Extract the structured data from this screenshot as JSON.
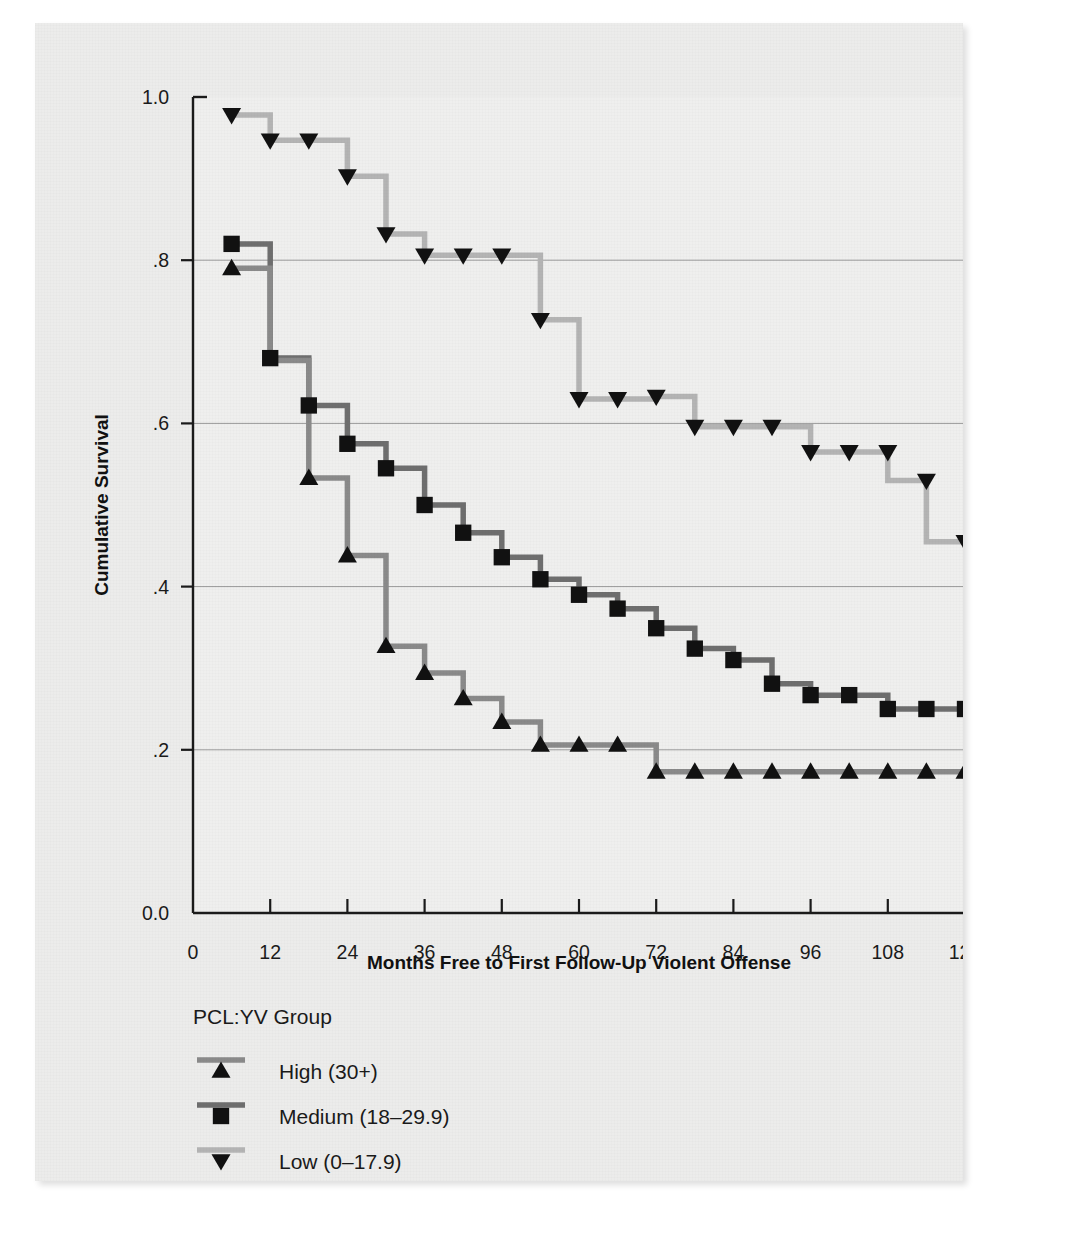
{
  "chart_data": {
    "type": "line",
    "subtype": "kaplan-meier-step",
    "title": "",
    "xlabel": "Months Free to First Follow-Up Violent Offense",
    "ylabel": "Cumulative Survival",
    "xlim": [
      0,
      120
    ],
    "ylim": [
      0.0,
      1.0
    ],
    "xticks": [
      0,
      12,
      24,
      36,
      48,
      60,
      72,
      84,
      96,
      108,
      120
    ],
    "xtick_labels": [
      "0",
      "12",
      "24",
      "36",
      "48",
      "60",
      "72",
      "84",
      "96",
      "108",
      "120"
    ],
    "yticks": [
      0.0,
      0.2,
      0.4,
      0.6,
      0.8,
      1.0
    ],
    "ytick_labels": [
      "0.0",
      ".2",
      ".4",
      ".6",
      ".8",
      "1.0"
    ],
    "grid": "horizontal gridlines at .2 .4 .6 .8",
    "legend_position": "below-axes-left",
    "legend_title": "PCL:YV Group",
    "series": [
      {
        "name": "High (30+)",
        "marker": "triangle-up",
        "color": "#8a8a8a",
        "marker_color": "#111111",
        "points": [
          {
            "x": 6,
            "y": 0.79
          },
          {
            "x": 12,
            "y": 0.79
          },
          {
            "x": 12,
            "y": 0.677
          },
          {
            "x": 18,
            "y": 0.677
          },
          {
            "x": 18,
            "y": 0.533
          },
          {
            "x": 24,
            "y": 0.533
          },
          {
            "x": 24,
            "y": 0.438
          },
          {
            "x": 30,
            "y": 0.438
          },
          {
            "x": 30,
            "y": 0.327
          },
          {
            "x": 36,
            "y": 0.327
          },
          {
            "x": 36,
            "y": 0.294
          },
          {
            "x": 42,
            "y": 0.294
          },
          {
            "x": 42,
            "y": 0.263
          },
          {
            "x": 48,
            "y": 0.263
          },
          {
            "x": 48,
            "y": 0.234
          },
          {
            "x": 54,
            "y": 0.234
          },
          {
            "x": 54,
            "y": 0.206
          },
          {
            "x": 66,
            "y": 0.206
          },
          {
            "x": 72,
            "y": 0.206
          },
          {
            "x": 72,
            "y": 0.173
          },
          {
            "x": 120,
            "y": 0.173
          }
        ],
        "marker_points": [
          {
            "x": 6,
            "y": 0.79
          },
          {
            "x": 18,
            "y": 0.533
          },
          {
            "x": 24,
            "y": 0.438
          },
          {
            "x": 30,
            "y": 0.327
          },
          {
            "x": 36,
            "y": 0.294
          },
          {
            "x": 42,
            "y": 0.263
          },
          {
            "x": 48,
            "y": 0.234
          },
          {
            "x": 54,
            "y": 0.206
          },
          {
            "x": 60,
            "y": 0.206
          },
          {
            "x": 66,
            "y": 0.206
          },
          {
            "x": 72,
            "y": 0.173
          },
          {
            "x": 78,
            "y": 0.173
          },
          {
            "x": 84,
            "y": 0.173
          },
          {
            "x": 90,
            "y": 0.173
          },
          {
            "x": 96,
            "y": 0.173
          },
          {
            "x": 102,
            "y": 0.173
          },
          {
            "x": 108,
            "y": 0.173
          },
          {
            "x": 114,
            "y": 0.173
          },
          {
            "x": 120,
            "y": 0.173
          }
        ]
      },
      {
        "name": "Medium (18–29.9)",
        "marker": "square",
        "color": "#6e6e6e",
        "marker_color": "#111111",
        "points": [
          {
            "x": 6,
            "y": 0.82
          },
          {
            "x": 12,
            "y": 0.82
          },
          {
            "x": 12,
            "y": 0.68
          },
          {
            "x": 18,
            "y": 0.68
          },
          {
            "x": 18,
            "y": 0.622
          },
          {
            "x": 24,
            "y": 0.622
          },
          {
            "x": 24,
            "y": 0.575
          },
          {
            "x": 30,
            "y": 0.575
          },
          {
            "x": 30,
            "y": 0.545
          },
          {
            "x": 36,
            "y": 0.545
          },
          {
            "x": 36,
            "y": 0.5
          },
          {
            "x": 42,
            "y": 0.5
          },
          {
            "x": 42,
            "y": 0.466
          },
          {
            "x": 48,
            "y": 0.466
          },
          {
            "x": 48,
            "y": 0.436
          },
          {
            "x": 54,
            "y": 0.436
          },
          {
            "x": 54,
            "y": 0.409
          },
          {
            "x": 60,
            "y": 0.409
          },
          {
            "x": 60,
            "y": 0.39
          },
          {
            "x": 66,
            "y": 0.39
          },
          {
            "x": 66,
            "y": 0.373
          },
          {
            "x": 72,
            "y": 0.373
          },
          {
            "x": 72,
            "y": 0.349
          },
          {
            "x": 78,
            "y": 0.349
          },
          {
            "x": 78,
            "y": 0.324
          },
          {
            "x": 84,
            "y": 0.324
          },
          {
            "x": 84,
            "y": 0.31
          },
          {
            "x": 90,
            "y": 0.31
          },
          {
            "x": 90,
            "y": 0.281
          },
          {
            "x": 96,
            "y": 0.281
          },
          {
            "x": 96,
            "y": 0.267
          },
          {
            "x": 108,
            "y": 0.267
          },
          {
            "x": 108,
            "y": 0.25
          },
          {
            "x": 120,
            "y": 0.25
          }
        ],
        "marker_points": [
          {
            "x": 6,
            "y": 0.82
          },
          {
            "x": 12,
            "y": 0.68
          },
          {
            "x": 18,
            "y": 0.622
          },
          {
            "x": 24,
            "y": 0.575
          },
          {
            "x": 30,
            "y": 0.545
          },
          {
            "x": 36,
            "y": 0.5
          },
          {
            "x": 42,
            "y": 0.466
          },
          {
            "x": 48,
            "y": 0.436
          },
          {
            "x": 54,
            "y": 0.409
          },
          {
            "x": 60,
            "y": 0.39
          },
          {
            "x": 66,
            "y": 0.373
          },
          {
            "x": 72,
            "y": 0.349
          },
          {
            "x": 78,
            "y": 0.324
          },
          {
            "x": 84,
            "y": 0.31
          },
          {
            "x": 90,
            "y": 0.281
          },
          {
            "x": 96,
            "y": 0.267
          },
          {
            "x": 102,
            "y": 0.267
          },
          {
            "x": 108,
            "y": 0.25
          },
          {
            "x": 114,
            "y": 0.25
          },
          {
            "x": 120,
            "y": 0.25
          }
        ]
      },
      {
        "name": "Low (0–17.9)",
        "marker": "triangle-down",
        "color": "#b4b4b4",
        "marker_color": "#111111",
        "points": [
          {
            "x": 6,
            "y": 0.978
          },
          {
            "x": 12,
            "y": 0.978
          },
          {
            "x": 12,
            "y": 0.947
          },
          {
            "x": 24,
            "y": 0.947
          },
          {
            "x": 24,
            "y": 0.903
          },
          {
            "x": 30,
            "y": 0.903
          },
          {
            "x": 30,
            "y": 0.832
          },
          {
            "x": 36,
            "y": 0.832
          },
          {
            "x": 36,
            "y": 0.806
          },
          {
            "x": 48,
            "y": 0.806
          },
          {
            "x": 54,
            "y": 0.806
          },
          {
            "x": 54,
            "y": 0.727
          },
          {
            "x": 60,
            "y": 0.727
          },
          {
            "x": 60,
            "y": 0.63
          },
          {
            "x": 72,
            "y": 0.63
          },
          {
            "x": 72,
            "y": 0.633
          },
          {
            "x": 78,
            "y": 0.633
          },
          {
            "x": 78,
            "y": 0.596
          },
          {
            "x": 96,
            "y": 0.596
          },
          {
            "x": 96,
            "y": 0.565
          },
          {
            "x": 108,
            "y": 0.565
          },
          {
            "x": 108,
            "y": 0.53
          },
          {
            "x": 114,
            "y": 0.53
          },
          {
            "x": 114,
            "y": 0.455
          },
          {
            "x": 120,
            "y": 0.455
          }
        ],
        "marker_points": [
          {
            "x": 6,
            "y": 0.978
          },
          {
            "x": 12,
            "y": 0.947
          },
          {
            "x": 18,
            "y": 0.947
          },
          {
            "x": 24,
            "y": 0.903
          },
          {
            "x": 30,
            "y": 0.832
          },
          {
            "x": 36,
            "y": 0.806
          },
          {
            "x": 42,
            "y": 0.806
          },
          {
            "x": 48,
            "y": 0.806
          },
          {
            "x": 54,
            "y": 0.727
          },
          {
            "x": 60,
            "y": 0.63
          },
          {
            "x": 66,
            "y": 0.63
          },
          {
            "x": 72,
            "y": 0.633
          },
          {
            "x": 78,
            "y": 0.596
          },
          {
            "x": 84,
            "y": 0.596
          },
          {
            "x": 90,
            "y": 0.596
          },
          {
            "x": 96,
            "y": 0.565
          },
          {
            "x": 102,
            "y": 0.565
          },
          {
            "x": 108,
            "y": 0.565
          },
          {
            "x": 114,
            "y": 0.53
          },
          {
            "x": 120,
            "y": 0.455
          }
        ]
      }
    ]
  },
  "legend": {
    "title": "PCL:YV Group",
    "items": [
      {
        "label": "High (30+)",
        "marker": "triangle-up",
        "line_color": "#8a8a8a"
      },
      {
        "label": "Medium (18–29.9)",
        "marker": "square",
        "line_color": "#6e6e6e"
      },
      {
        "label": "Low (0–17.9)",
        "marker": "triangle-down",
        "line_color": "#b4b4b4"
      }
    ]
  },
  "colors": {
    "background": "#ececeb",
    "plot_background": "#efefee",
    "axis": "#1a1a1a",
    "gridline": "#9a9a9a",
    "high_line": "#8a8a8a",
    "medium_line": "#6e6e6e",
    "low_line": "#b4b4b4",
    "marker": "#111111"
  }
}
